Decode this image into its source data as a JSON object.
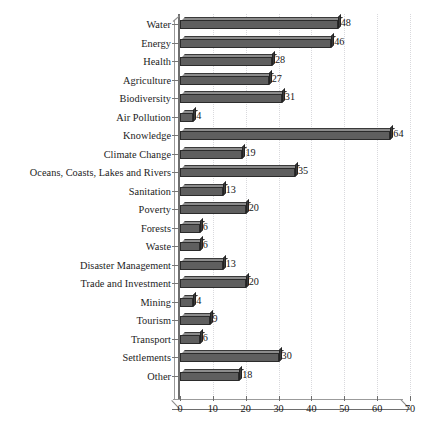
{
  "chart_data": {
    "type": "bar",
    "orientation": "horizontal",
    "title": "",
    "subtitle": "",
    "xlabel": "",
    "ylabel": "",
    "xlim": [
      0,
      70
    ],
    "xticks": [
      0,
      10,
      20,
      30,
      40,
      50,
      60,
      70
    ],
    "grid": true,
    "grid_axis": "x",
    "legend": false,
    "show_value_labels": true,
    "style": "3d-bar",
    "categories": [
      "Water",
      "Energy",
      "Health",
      "Agriculture",
      "Biodiversity",
      "Air Pollution",
      "Knowledge",
      "Climate Change",
      "Oceans, Coasts, Lakes and Rivers",
      "Sanitation",
      "Poverty",
      "Forests",
      "Waste",
      "Disaster Management",
      "Trade and Investment",
      "Mining",
      "Tourism",
      "Transport",
      "Settlements",
      "Other"
    ],
    "values": [
      48,
      46,
      28,
      27,
      31,
      4,
      64,
      19,
      35,
      13,
      20,
      6,
      6,
      13,
      20,
      4,
      9,
      6,
      30,
      18
    ],
    "series": [
      {
        "name": "Count",
        "values": [
          48,
          46,
          28,
          27,
          31,
          4,
          64,
          19,
          35,
          13,
          20,
          6,
          6,
          13,
          20,
          4,
          9,
          6,
          30,
          18
        ]
      }
    ],
    "colors": {
      "bar_face": "#5f5f5f",
      "bar_top": "#8c8c8c",
      "bar_cap": "#3b3b3b",
      "bar_outline": "#2b2b2b",
      "gridline": "#d9d9dd",
      "axis": "#6d6d6d",
      "text": "#171717",
      "background": "#ffffff"
    }
  }
}
